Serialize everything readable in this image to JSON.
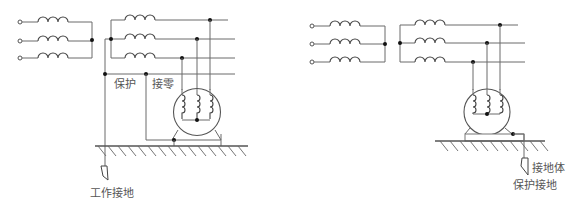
{
  "diagrams": [
    {
      "id": "left",
      "title": "保护接零",
      "labels": {
        "protect": "保护",
        "neutral": "接零",
        "working_ground": "工作接地"
      }
    },
    {
      "id": "right",
      "title": "保护接地",
      "labels": {
        "ground_body": "接地体",
        "protective_ground": "保护接地"
      }
    }
  ],
  "colors": {
    "line": "#6a6a6a",
    "dot": "#111111",
    "text": "#555555"
  }
}
